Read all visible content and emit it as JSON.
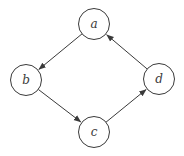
{
  "diagram": {
    "type": "directed-graph",
    "background": "#ffffff",
    "stroke_color": "#3a3a3a",
    "node_fill": "#ffffff",
    "label_color": "#3a3a3a",
    "node_radius": 15.5,
    "stroke_width": 1,
    "canvas": {
      "width": 184,
      "height": 156
    },
    "nodes": [
      {
        "id": "a",
        "label": "a",
        "x": 94,
        "y": 24
      },
      {
        "id": "b",
        "label": "b",
        "x": 26,
        "y": 80
      },
      {
        "id": "c",
        "label": "c",
        "x": 94,
        "y": 132
      },
      {
        "id": "d",
        "label": "d",
        "x": 159,
        "y": 79
      }
    ],
    "edges": [
      {
        "from": "a",
        "to": "b"
      },
      {
        "from": "b",
        "to": "c"
      },
      {
        "from": "c",
        "to": "d"
      },
      {
        "from": "d",
        "to": "a"
      }
    ]
  }
}
